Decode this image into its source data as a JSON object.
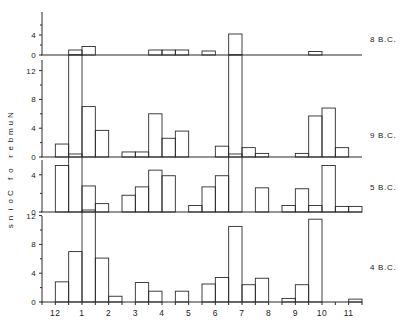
{
  "figure": {
    "y_axis_title": "Number of Coins",
    "panel_labels": [
      "8 B.C.",
      "9 B.C.",
      "5 B.C.",
      "4 B.C."
    ],
    "x_tick_labels": [
      "12",
      "1",
      "2",
      "3",
      "4",
      "5",
      "6",
      "7",
      "8",
      "9",
      "10",
      "11"
    ],
    "ink_color": "#2b2b2b",
    "background_color": "#ffffff"
  },
  "chart_data": {
    "type": "bar",
    "title": "",
    "subtitle": "",
    "xlabel": "",
    "ylabel": "Number of Coins",
    "grid": false,
    "legend_position": "right",
    "note": "Four stacked histogram panels of coin counts by month; each month is split into two half-month bins. Panel identity is given by the right-hand label.",
    "categories": [
      "12",
      "1",
      "2",
      "3",
      "4",
      "5",
      "6",
      "7",
      "8",
      "9",
      "10",
      "11"
    ],
    "bins_per_category": 2,
    "panels": [
      {
        "name": "8 B.C.",
        "ylim": [
          0,
          6
        ],
        "yticks": [
          0,
          4
        ],
        "ytick_labels": [
          "0",
          "4"
        ],
        "values": [
          0,
          0,
          1.0,
          1.7,
          0,
          0,
          0,
          0,
          1.0,
          1.0,
          1.0,
          0,
          0.8,
          0,
          4.2,
          0,
          0,
          0,
          0,
          0,
          0.7,
          0,
          0,
          0
        ]
      },
      {
        "name": "9 B.C.",
        "ylim": [
          0,
          15
        ],
        "yticks": [
          0,
          4,
          8,
          12
        ],
        "ytick_labels": [
          "0",
          "4",
          "8",
          "12"
        ],
        "values": [
          0,
          1.8,
          14.2,
          7.0,
          3.7,
          0,
          0.7,
          0.7,
          6.0,
          2.6,
          3.6,
          0,
          0,
          1.5,
          14.2,
          1.3,
          0.5,
          0,
          0,
          0.5,
          5.7,
          6.8,
          1.3,
          0
        ]
      },
      {
        "name": "5 B.C.",
        "ylim": [
          0,
          6
        ],
        "yticks": [
          0,
          4
        ],
        "ytick_labels": [
          "0",
          "4"
        ],
        "values": [
          0,
          5.0,
          6.4,
          2.8,
          0.9,
          0,
          1.8,
          2.7,
          4.5,
          3.9,
          0,
          0.7,
          2.7,
          3.9,
          6.4,
          0,
          2.6,
          0,
          0.7,
          2.5,
          0.7,
          5.0,
          0.6,
          0.6
        ]
      },
      {
        "name": "4 B.C.",
        "ylim": [
          0,
          15
        ],
        "yticks": [
          0,
          4,
          8,
          12
        ],
        "ytick_labels": [
          "0",
          "4",
          "8",
          "12"
        ],
        "values": [
          0,
          2.8,
          7.0,
          15.0,
          6.1,
          0.8,
          0,
          2.7,
          1.5,
          0,
          1.5,
          0,
          2.5,
          3.4,
          10.5,
          2.4,
          3.3,
          0,
          0.5,
          2.4,
          11.5,
          0,
          0,
          0.4
        ]
      }
    ]
  }
}
